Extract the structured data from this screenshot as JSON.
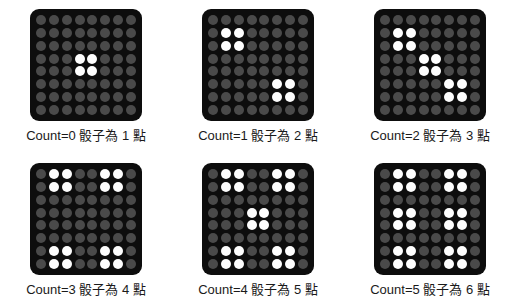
{
  "colors": {
    "panel_background": "#0d0d0d",
    "led_off": "#4a4a4a",
    "led_on": "#fdfdfd",
    "page_background": "#ffffff",
    "caption_text": "#1a1a1a"
  },
  "matrix": {
    "rows": 8,
    "columns": 8
  },
  "panels": [
    {
      "id": "panel-count-0",
      "caption": "Count=0 骰子為 1 點",
      "count": 0,
      "pips": 1,
      "leds": [
        [
          0,
          0,
          0,
          0,
          0,
          0,
          0,
          0
        ],
        [
          0,
          0,
          0,
          0,
          0,
          0,
          0,
          0
        ],
        [
          0,
          0,
          0,
          0,
          0,
          0,
          0,
          0
        ],
        [
          0,
          0,
          0,
          1,
          1,
          0,
          0,
          0
        ],
        [
          0,
          0,
          0,
          1,
          1,
          0,
          0,
          0
        ],
        [
          0,
          0,
          0,
          0,
          0,
          0,
          0,
          0
        ],
        [
          0,
          0,
          0,
          0,
          0,
          0,
          0,
          0
        ],
        [
          0,
          0,
          0,
          0,
          0,
          0,
          0,
          0
        ]
      ]
    },
    {
      "id": "panel-count-1",
      "caption": "Count=1 骰子為 2 點",
      "count": 1,
      "pips": 2,
      "leds": [
        [
          0,
          0,
          0,
          0,
          0,
          0,
          0,
          0
        ],
        [
          0,
          1,
          1,
          0,
          0,
          0,
          0,
          0
        ],
        [
          0,
          1,
          1,
          0,
          0,
          0,
          0,
          0
        ],
        [
          0,
          0,
          0,
          0,
          0,
          0,
          0,
          0
        ],
        [
          0,
          0,
          0,
          0,
          0,
          0,
          0,
          0
        ],
        [
          0,
          0,
          0,
          0,
          0,
          1,
          1,
          0
        ],
        [
          0,
          0,
          0,
          0,
          0,
          1,
          1,
          0
        ],
        [
          0,
          0,
          0,
          0,
          0,
          0,
          0,
          0
        ]
      ]
    },
    {
      "id": "panel-count-2",
      "caption": "Count=2 骰子為 3 點",
      "count": 2,
      "pips": 3,
      "leds": [
        [
          0,
          0,
          0,
          0,
          0,
          0,
          0,
          0
        ],
        [
          0,
          1,
          1,
          0,
          0,
          0,
          0,
          0
        ],
        [
          0,
          1,
          1,
          0,
          0,
          0,
          0,
          0
        ],
        [
          0,
          0,
          0,
          1,
          1,
          0,
          0,
          0
        ],
        [
          0,
          0,
          0,
          1,
          1,
          0,
          0,
          0
        ],
        [
          0,
          0,
          0,
          0,
          0,
          1,
          1,
          0
        ],
        [
          0,
          0,
          0,
          0,
          0,
          1,
          1,
          0
        ],
        [
          0,
          0,
          0,
          0,
          0,
          0,
          0,
          0
        ]
      ]
    },
    {
      "id": "panel-count-3",
      "caption": "Count=3 骰子為 4 點",
      "count": 3,
      "pips": 4,
      "leds": [
        [
          0,
          1,
          1,
          0,
          0,
          1,
          1,
          0
        ],
        [
          0,
          1,
          1,
          0,
          0,
          1,
          1,
          0
        ],
        [
          0,
          0,
          0,
          0,
          0,
          0,
          0,
          0
        ],
        [
          0,
          0,
          0,
          0,
          0,
          0,
          0,
          0
        ],
        [
          0,
          0,
          0,
          0,
          0,
          0,
          0,
          0
        ],
        [
          0,
          0,
          0,
          0,
          0,
          0,
          0,
          0
        ],
        [
          0,
          1,
          1,
          0,
          0,
          1,
          1,
          0
        ],
        [
          0,
          1,
          1,
          0,
          0,
          1,
          1,
          0
        ]
      ]
    },
    {
      "id": "panel-count-4",
      "caption": "Count=4 骰子為 5 點",
      "count": 4,
      "pips": 5,
      "leds": [
        [
          0,
          1,
          1,
          0,
          0,
          1,
          1,
          0
        ],
        [
          0,
          1,
          1,
          0,
          0,
          1,
          1,
          0
        ],
        [
          0,
          0,
          0,
          0,
          0,
          0,
          0,
          0
        ],
        [
          0,
          0,
          0,
          1,
          1,
          0,
          0,
          0
        ],
        [
          0,
          0,
          0,
          1,
          1,
          0,
          0,
          0
        ],
        [
          0,
          0,
          0,
          0,
          0,
          0,
          0,
          0
        ],
        [
          0,
          1,
          1,
          0,
          0,
          1,
          1,
          0
        ],
        [
          0,
          1,
          1,
          0,
          0,
          1,
          1,
          0
        ]
      ]
    },
    {
      "id": "panel-count-5",
      "caption": "Count=5 骰子為 6 點",
      "count": 5,
      "pips": 6,
      "leds": [
        [
          0,
          1,
          1,
          0,
          0,
          1,
          1,
          0
        ],
        [
          0,
          1,
          1,
          0,
          0,
          1,
          1,
          0
        ],
        [
          0,
          0,
          0,
          0,
          0,
          0,
          0,
          0
        ],
        [
          0,
          1,
          1,
          0,
          0,
          1,
          1,
          0
        ],
        [
          0,
          1,
          1,
          0,
          0,
          1,
          1,
          0
        ],
        [
          0,
          0,
          0,
          0,
          0,
          0,
          0,
          0
        ],
        [
          0,
          1,
          1,
          0,
          0,
          1,
          1,
          0
        ],
        [
          0,
          1,
          1,
          0,
          0,
          1,
          1,
          0
        ]
      ]
    }
  ]
}
